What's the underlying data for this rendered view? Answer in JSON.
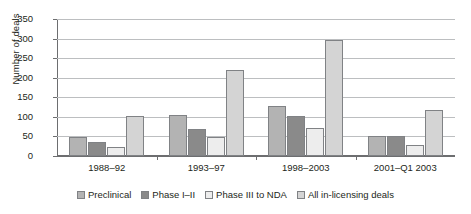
{
  "chart_data": {
    "type": "bar",
    "title": "",
    "subtitle": "",
    "xlabel": "",
    "ylabel": "Number of deals",
    "categories": [
      "1988–92",
      "1993–97",
      "1998–2003",
      "2001–Q1 2003"
    ],
    "series": [
      {
        "name": "Preclinical",
        "color": "#b3b3b3",
        "values": [
          48,
          105,
          128,
          52
        ]
      },
      {
        "name": "Phase I–II",
        "color": "#8a8a8a",
        "values": [
          35,
          68,
          102,
          51
        ]
      },
      {
        "name": "Phase III to NDA",
        "color": "#ededed",
        "values": [
          22,
          48,
          72,
          28
        ]
      },
      {
        "name": "All in-licensing deals",
        "color": "#d4d4d4",
        "values": [
          101,
          221,
          297,
          118
        ]
      }
    ],
    "ylim": [
      0,
      350
    ],
    "ytick_step": 50,
    "yticks": [
      350,
      300,
      250,
      200,
      150,
      100,
      50,
      0
    ],
    "grid": true,
    "legend_position": "bottom",
    "bar_border_color": "#808285",
    "axis_color": "#6d6e70",
    "gridline_color": "#bcbec0"
  }
}
